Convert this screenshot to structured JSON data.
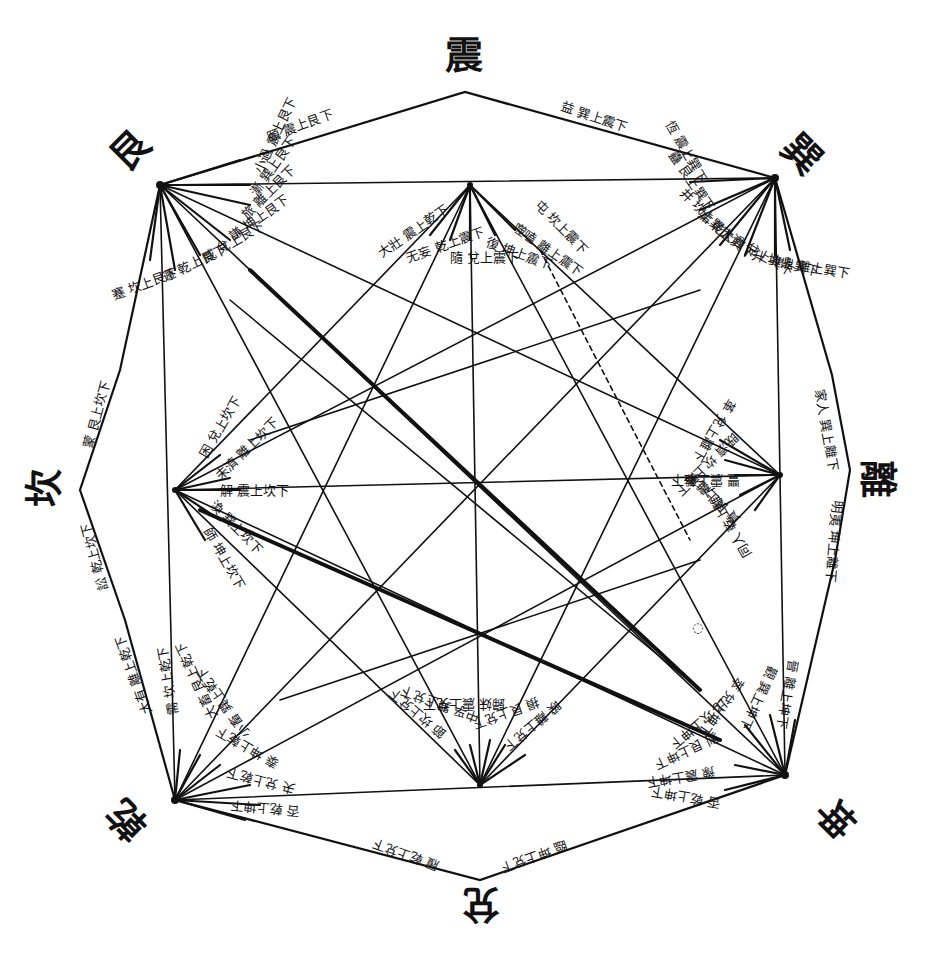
{
  "trigrams": {
    "top": "震",
    "top_right": "巽",
    "right": "離",
    "bottom_right": "坤",
    "bottom": "兌",
    "bottom_left": "乾",
    "left": "坎",
    "top_left": "艮"
  },
  "edge_labels": {
    "top_left_edge": "頤 震上艮下",
    "top_right_edge": "益 巽上震下",
    "right_upper_edge": "家人 巽上離下",
    "right_lower_edge": "明夷 坤上離下",
    "bottom_right_edge": "臨 坤上兌下",
    "bottom_left_edge": "履 乾上兌下",
    "left_lower_edge": "訟 乾上坎下",
    "left_upper_edge": "蒙 艮上坎下"
  },
  "clusters": {
    "top_left": [
      "蹇 坎上艮下",
      "遯 乾上艮下",
      "咸 兌上艮下",
      "謙 坤上艮下",
      "旅 離上艮下",
      "漸 巽上艮下",
      "小過 震上艮下"
    ],
    "top_right": [
      "恆 震上巽下",
      "蠱 艮上巽下",
      "井 坎上巽下",
      "姤 乾上巽下",
      "大過 兌上巽下",
      "升 坤上巽下",
      "鼎 離上巽下"
    ],
    "top_inner": [
      "大壯 震上乾下",
      "无妄 乾上震下",
      "隨 兌上震下",
      "復 坤上震下",
      "噬嗑 離上震下",
      "屯 坎上震下"
    ],
    "left_inner": [
      "困 兌上坎下",
      "未濟 離上坎下",
      "解 震上坎下",
      "渙 巽上坎下",
      "師 坤上坎下"
    ],
    "right_inner": [
      "革 兌上離下",
      "既濟 坎上離下",
      "豐 震上離下",
      "賁 艮上離下",
      "同人 乾上離下"
    ],
    "bottom_inner": [
      "節 坎上兌下",
      "中孚 巽上兌下",
      "歸妹 震上兌下",
      "損 艮上兌下",
      "睽 離上兌下"
    ],
    "bottom_left": [
      "大有 離上乾下",
      "需 坎上乾下",
      "大畜 艮上乾下",
      "小畜 巽上乾下",
      "泰 坤上乾下",
      "夬 兌上乾下",
      "否 乾上坤下"
    ],
    "bottom_right": [
      "晉 離上坤下",
      "觀 巽上坤下",
      "萃 兌上坤下",
      "比 坎上坤下",
      "剝 艮上坤下",
      "豫 震上坤下",
      "否 乾上坤下"
    ]
  },
  "marks": {
    "stray_mark": "◌"
  }
}
